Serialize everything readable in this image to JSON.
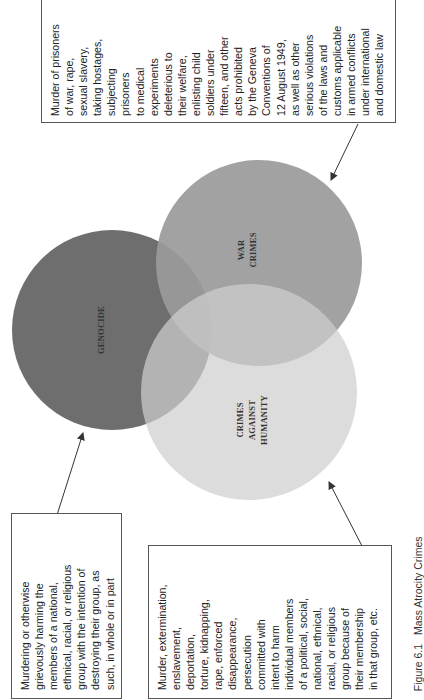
{
  "figure": {
    "caption_number": "Figure 6.1",
    "caption_title": "Mass Atrocity Crimes",
    "orientation": "rotated 90° counter-clockwise"
  },
  "circles": [
    {
      "id": "genocide",
      "label_lines": [
        "GENOCIDE"
      ],
      "color": "#6e6e6e"
    },
    {
      "id": "war-crimes",
      "label_lines": [
        "WAR",
        "CRIMES"
      ],
      "color": "#9a9a9a"
    },
    {
      "id": "crimes-against-humanity",
      "label_lines": [
        "CRIMES",
        "AGAINST",
        "HUMANITY"
      ],
      "color": "#c9c9c9"
    }
  ],
  "descriptions": {
    "war_crimes": "Murder of prisoners\nof war, rape,\nsexual slavery,\ntaking hostages,\nsubjecting\nprisoners\nto medical\nexperiments\ndeleterious to\ntheir welfare,\nenlisting child\nsoldiers under\nfifteen, and other\nacts prohibited\nby the Geneva\nConventions of\n12 August 1949,\nas well as other\nserious violations\nof the laws and\ncustoms applicable\nin armed conflicts\nunder international\nand domestic law",
    "genocide": "Murdering or otherwise\ngrievously harming the\nmembers of a national,\nethnical, racial, or religious\ngroup with the intention of\ndestroying their group, as\nsuch, in whole or in part",
    "crimes_against_humanity": "Murder, extermination,\nenslavement,\ndeportation,\ntorture, kidnapping,\nrape, enforced\ndisappearance,\npersecution\ncommitted with\nintent to harm\nindividual members\nof a political, social,\nnational, ethnical,\nracial, or religious\ngroup because of\ntheir membership\nin that group, etc."
  },
  "colors": {
    "border": "#555555",
    "arrow": "#333333",
    "text": "#222222",
    "background": "#ffffff"
  }
}
